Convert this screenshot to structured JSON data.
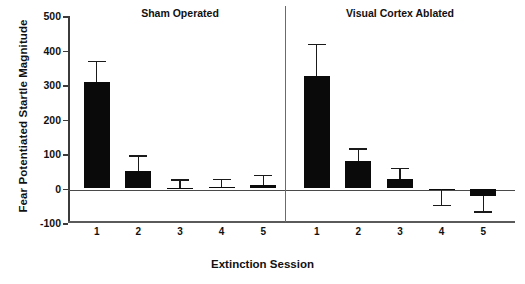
{
  "chart_data": {
    "type": "bar",
    "title": "",
    "xlabel": "Extinction Session",
    "ylabel": "Fear Potentiated Startle Magnitude",
    "ylim": [
      -100,
      500
    ],
    "yticks": [
      500,
      400,
      300,
      200,
      100,
      0,
      -100
    ],
    "ytick_labels": [
      "500",
      "400",
      "300",
      "200",
      "100",
      "0",
      "-100"
    ],
    "grid": false,
    "legend": "none",
    "panels": [
      {
        "name": "sham",
        "title": "Sham Operated",
        "categories": [
          "1",
          "2",
          "3",
          "4",
          "5"
        ],
        "values": [
          308,
          52,
          2,
          4,
          10
        ],
        "errors": [
          62,
          45,
          25,
          24,
          30
        ],
        "bar_color": "#0a0a0a"
      },
      {
        "name": "ablated",
        "title": "Visual Cortex Ablated",
        "categories": [
          "1",
          "2",
          "3",
          "4",
          "5"
        ],
        "values": [
          327,
          80,
          28,
          -1,
          -22
        ],
        "errors": [
          93,
          36,
          32,
          46,
          44
        ],
        "bar_color": "#0a0a0a"
      }
    ]
  }
}
